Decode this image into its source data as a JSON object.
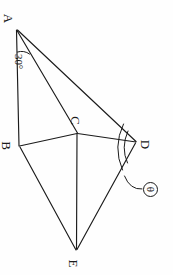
{
  "figure": {
    "kind": "geometry-diagram",
    "ink_color": "#1b1b1b",
    "paper_color": "#fefefe",
    "width": 173,
    "height": 275,
    "text_rotation_degrees": 90,
    "vertices": [
      {
        "id": "A",
        "label": "A",
        "x": 16,
        "y": 29,
        "label_x": 6,
        "label_y": 14
      },
      {
        "id": "B",
        "label": "B",
        "x": 19,
        "y": 146,
        "label_x": 3,
        "label_y": 140
      },
      {
        "id": "C",
        "label": "C",
        "x": 77,
        "y": 133,
        "label_x": 72,
        "label_y": 116
      },
      {
        "id": "D",
        "label": "D",
        "x": 136,
        "y": 142,
        "label_x": 140,
        "label_y": 141
      },
      {
        "id": "E",
        "label": "E",
        "x": 76,
        "y": 250,
        "label_x": 70,
        "label_y": 258
      }
    ],
    "edges": [
      {
        "from": "A",
        "to": "B"
      },
      {
        "from": "A",
        "to": "C"
      },
      {
        "from": "A",
        "to": "D"
      },
      {
        "from": "B",
        "to": "C"
      },
      {
        "from": "B",
        "to": "E"
      },
      {
        "from": "C",
        "to": "D"
      },
      {
        "from": "C",
        "to": "E"
      },
      {
        "from": "D",
        "to": "E"
      }
    ],
    "angles": [
      {
        "id": "angle-at-a",
        "label": "30°",
        "at_vertex": "A",
        "label_x": 17,
        "label_y": 46
      },
      {
        "id": "angle-at-d",
        "label": "θ",
        "at_vertex": "D",
        "marker": "circled-theta",
        "badge_x": 143,
        "badge_y": 183
      }
    ],
    "leader_line": {
      "id": "theta-leader",
      "from_x": 143,
      "from_y": 190,
      "to_x": 120,
      "to_y": 170
    }
  }
}
